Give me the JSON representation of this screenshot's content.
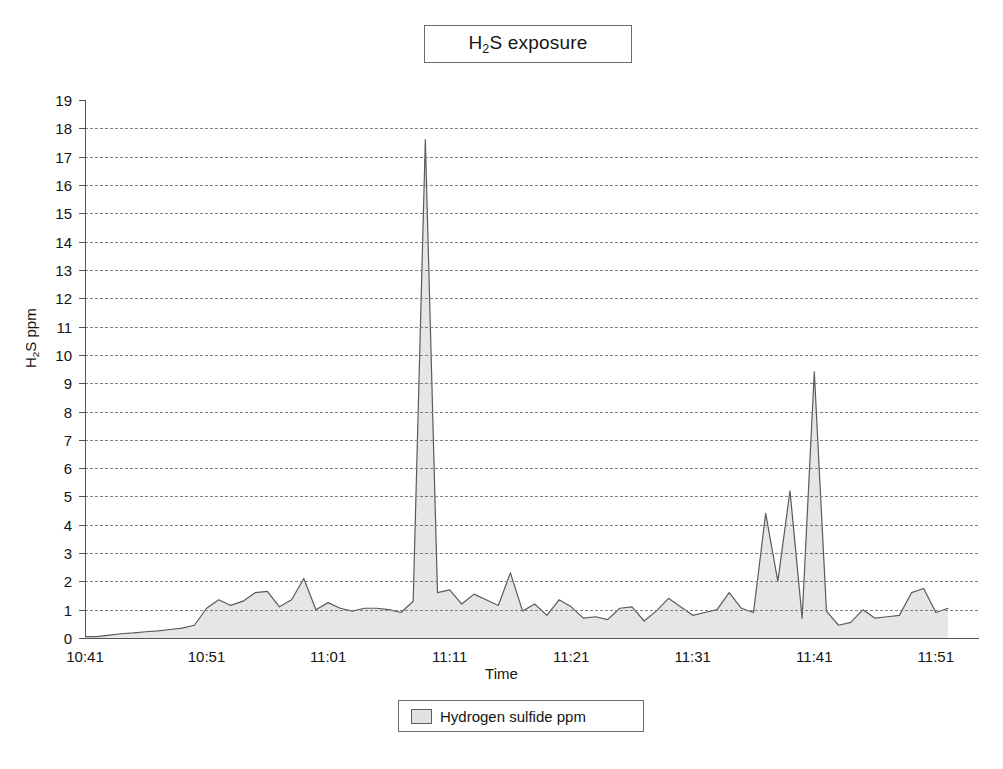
{
  "title": {
    "prefix": "H",
    "sub": "2",
    "suffix": "S exposure",
    "full": "H2S exposure"
  },
  "axes": {
    "ylabel_prefix": "H",
    "ylabel_sub": "2",
    "ylabel_suffix": "S ppm",
    "ylabel_full": "H2S ppm",
    "xlabel": "Time"
  },
  "legend": {
    "label": "Hydrogen sulfide ppm",
    "swatch_color": "#e2e2e2"
  },
  "chart_data": {
    "type": "area",
    "title": "H2S exposure",
    "xlabel": "Time",
    "ylabel": "H2S ppm",
    "ylim": [
      0,
      19
    ],
    "yticks": [
      0,
      1,
      2,
      3,
      4,
      5,
      6,
      7,
      8,
      9,
      10,
      11,
      12,
      13,
      14,
      15,
      16,
      17,
      18,
      19
    ],
    "xticks": [
      "10:41",
      "10:51",
      "11:01",
      "11:11",
      "11:21",
      "11:31",
      "11:41",
      "11:51"
    ],
    "xlim": [
      "10:41",
      "11:52"
    ],
    "grid": "horizontal-dashed",
    "legend_position": "bottom-center",
    "series": [
      {
        "name": "Hydrogen sulfide ppm",
        "fill_color": "#e6e6e6",
        "line_color": "#5a5a5a",
        "x": [
          "10:41",
          "10:42",
          "10:43",
          "10:44",
          "10:45",
          "10:46",
          "10:47",
          "10:48",
          "10:49",
          "10:50",
          "10:51",
          "10:52",
          "10:53",
          "10:54",
          "10:55",
          "10:56",
          "10:57",
          "10:58",
          "10:59",
          "11:00",
          "11:01",
          "11:02",
          "11:03",
          "11:04",
          "11:05",
          "11:06",
          "11:07",
          "11:08",
          "11:09",
          "11:10",
          "11:11",
          "11:12",
          "11:13",
          "11:14",
          "11:15",
          "11:16",
          "11:17",
          "11:18",
          "11:19",
          "11:20",
          "11:21",
          "11:22",
          "11:23",
          "11:24",
          "11:25",
          "11:26",
          "11:27",
          "11:28",
          "11:29",
          "11:30",
          "11:31",
          "11:32",
          "11:33",
          "11:34",
          "11:35",
          "11:36",
          "11:37",
          "11:38",
          "11:39",
          "11:40",
          "11:41",
          "11:42",
          "11:43",
          "11:44",
          "11:45",
          "11:46",
          "11:47",
          "11:48",
          "11:49",
          "11:50",
          "11:51",
          "11:52"
        ],
        "values": [
          0.05,
          0.05,
          0.1,
          0.15,
          0.18,
          0.22,
          0.25,
          0.3,
          0.35,
          0.45,
          1.05,
          1.35,
          1.15,
          1.3,
          1.6,
          1.65,
          1.1,
          1.35,
          2.1,
          1.0,
          1.25,
          1.05,
          0.95,
          1.05,
          1.05,
          1.0,
          0.9,
          1.3,
          17.6,
          1.6,
          1.7,
          1.2,
          1.55,
          1.35,
          1.15,
          2.3,
          0.95,
          1.2,
          0.8,
          1.35,
          1.1,
          0.7,
          0.75,
          0.65,
          1.05,
          1.1,
          0.6,
          0.95,
          1.4,
          1.1,
          0.8,
          0.9,
          1.0,
          1.6,
          1.05,
          0.9,
          4.4,
          2.0,
          5.2,
          0.7,
          9.4,
          0.95,
          0.45,
          0.55,
          1.0,
          0.7,
          0.75,
          0.8,
          1.6,
          1.75,
          0.9,
          1.05
        ]
      }
    ]
  }
}
